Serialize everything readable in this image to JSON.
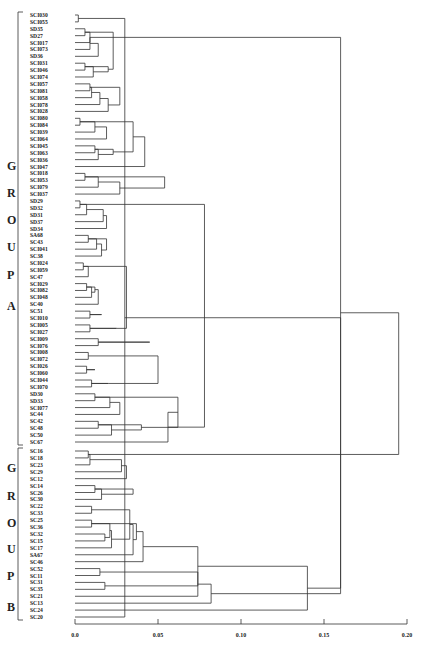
{
  "chart_data": {
    "type": "dendrogram",
    "title": "",
    "xlabel": "",
    "ylabel": "",
    "xlim": [
      0.0,
      0.2
    ],
    "x_ticks": [
      "0.0",
      "0.05",
      "0.10",
      "0.15",
      "0.20"
    ],
    "groups": [
      {
        "name": "GROUP A",
        "letters": [
          "G",
          "R",
          "O",
          "U",
          "P",
          "A"
        ]
      },
      {
        "name": "GROUP B",
        "letters": [
          "G",
          "R",
          "O",
          "U",
          "P",
          "B"
        ]
      }
    ],
    "leaves": [
      "SCI030",
      "SCI055",
      "SD35",
      "SD27",
      "SCI017",
      "SCI073",
      "SD36",
      "SCI031",
      "SCI046",
      "SCI074",
      "SCI057",
      "SCI081",
      "SCI058",
      "SCI078",
      "SCI028",
      "SCI080",
      "SCI084",
      "SCI039",
      "SCI064",
      "SCI045",
      "SCI063",
      "SCI036",
      "SCI047",
      "SCI018",
      "SCI053",
      "SCI079",
      "SCI037",
      "SD29",
      "SD32",
      "SD31",
      "SD37",
      "SD34",
      "SA68",
      "SC43",
      "SCI041",
      "SC38",
      "SCI024",
      "SCI059",
      "SC47",
      "SCI029",
      "SCI082",
      "SCI048",
      "SC40",
      "SC51",
      "SCI010",
      "SCI005",
      "SCI027",
      "SCI009",
      "SCI076",
      "SCI008",
      "SCI072",
      "SCI026",
      "SCI060",
      "SCI044",
      "SCI070",
      "SD30",
      "SD33",
      "SCI077",
      "SC44",
      "SC42",
      "SC48",
      "SC50",
      "SC67",
      "SC16",
      "SC18",
      "SC23",
      "SC29",
      "SC12",
      "SC14",
      "SC26",
      "SC30",
      "SC22",
      "SC33",
      "SC25",
      "SC36",
      "SC32",
      "SC15",
      "SC17",
      "SA67",
      "SC46",
      "SC52",
      "SC11",
      "SC31",
      "SC35",
      "SC21",
      "SC13",
      "SC24",
      "SC20"
    ],
    "group_a_range": [
      0,
      62
    ],
    "group_b_range": [
      63,
      89
    ],
    "root_height": 0.195,
    "group_a_join_height": 0.078,
    "notable_merges": [
      {
        "between": [
          "SC13",
          "SC24"
        ],
        "height": 0.03
      },
      {
        "between": [
          "SC13-cluster",
          "SC20"
        ],
        "height": 0.16
      },
      {
        "between": [
          "GroupB-main",
          "SC21"
        ],
        "height": 0.14
      },
      {
        "between": [
          "GROUP A",
          "GROUP B"
        ],
        "height": 0.195
      }
    ]
  },
  "tree": [
    [
      0,
      1,
      0.002
    ],
    [
      2,
      3,
      0.006
    ],
    [
      90,
      4,
      0.009
    ],
    [
      91,
      5,
      0.009
    ],
    [
      92,
      6,
      0.014
    ],
    [
      7,
      8,
      0.006
    ],
    [
      94,
      9,
      0.011
    ],
    [
      93,
      95,
      0.02
    ],
    [
      89,
      96,
      0.023
    ],
    [
      10,
      11,
      0.009
    ],
    [
      98,
      12,
      0.01
    ],
    [
      99,
      13,
      0.015
    ],
    [
      100,
      14,
      0.02
    ],
    [
      97,
      101,
      0.027
    ],
    [
      15,
      16,
      0.003
    ],
    [
      103,
      17,
      0.012
    ],
    [
      104,
      18,
      0.019
    ],
    [
      19,
      20,
      0.012
    ],
    [
      106,
      21,
      0.014
    ],
    [
      105,
      107,
      0.023
    ],
    [
      102,
      108,
      0.035
    ],
    [
      109,
      22,
      0.042
    ],
    [
      23,
      24,
      0.006
    ],
    [
      111,
      25,
      0.014
    ],
    [
      112,
      26,
      0.027
    ],
    [
      110,
      113,
      0.054
    ],
    [
      27,
      28,
      0.003
    ],
    [
      115,
      29,
      0.007
    ],
    [
      116,
      30,
      0.017
    ],
    [
      117,
      31,
      0.019
    ],
    [
      32,
      33,
      0.008
    ],
    [
      119,
      34,
      0.013
    ],
    [
      120,
      35,
      0.016
    ],
    [
      118,
      121,
      0.019
    ],
    [
      36,
      37,
      0.005
    ],
    [
      123,
      38,
      0.008
    ],
    [
      39,
      40,
      0.007
    ],
    [
      125,
      41,
      0.01
    ],
    [
      124,
      126,
      0.012
    ],
    [
      127,
      42,
      0.014
    ],
    [
      43,
      44,
      0.009
    ],
    [
      128,
      129,
      0.016
    ],
    [
      45,
      46,
      0.009
    ],
    [
      130,
      131,
      0.025
    ],
    [
      122,
      132,
      0.031
    ],
    [
      47,
      48,
      0.014
    ],
    [
      133,
      134,
      0.045
    ],
    [
      49,
      50,
      0.008
    ],
    [
      51,
      52,
      0.007
    ],
    [
      136,
      137,
      0.012
    ],
    [
      53,
      54,
      0.01
    ],
    [
      138,
      139,
      0.02
    ],
    [
      135,
      140,
      0.05
    ],
    [
      55,
      56,
      0.012
    ],
    [
      142,
      57,
      0.021
    ],
    [
      143,
      58,
      0.027
    ],
    [
      59,
      60,
      0.014
    ],
    [
      145,
      61,
      0.022
    ],
    [
      144,
      146,
      0.04
    ],
    [
      141,
      147,
      0.062
    ],
    [
      148,
      62,
      0.056
    ],
    [
      114,
      149,
      0.078
    ],
    [
      63,
      64,
      0.008
    ],
    [
      151,
      65,
      0.009
    ],
    [
      152,
      66,
      0.028
    ],
    [
      153,
      67,
      0.031
    ],
    [
      68,
      69,
      0.012
    ],
    [
      155,
      70,
      0.016
    ],
    [
      154,
      156,
      0.035
    ],
    [
      71,
      72,
      0.01
    ],
    [
      73,
      74,
      0.01
    ],
    [
      75,
      76,
      0.018
    ],
    [
      158,
      159,
      0.021
    ],
    [
      160,
      77,
      0.022
    ],
    [
      157,
      161,
      0.033
    ],
    [
      162,
      78,
      0.035
    ],
    [
      157.5,
      163,
      0.037
    ],
    [
      164,
      79,
      0.041
    ],
    [
      80,
      81,
      0.015
    ],
    [
      82,
      83,
      0.018
    ],
    [
      166,
      84,
      0.074
    ],
    [
      165,
      167,
      0.074
    ],
    [
      168,
      85,
      0.082
    ],
    [
      169,
      86,
      0.14
    ],
    [
      87,
      88,
      0.03
    ],
    [
      171,
      89.5,
      0.16
    ],
    [
      170,
      172,
      0.16
    ],
    [
      150,
      173,
      0.195
    ]
  ]
}
